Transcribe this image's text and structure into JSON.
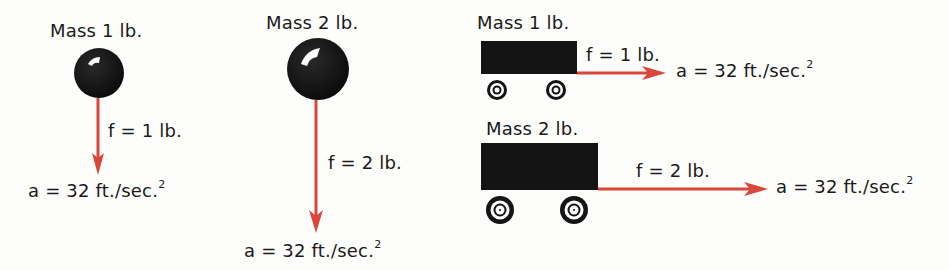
{
  "colors": {
    "arrow": "#d9473a",
    "mass": "#141414"
  },
  "panels": [
    {
      "id": "ball-1",
      "mass_label": "Mass 1 lb.",
      "force_label": "f = 1 lb.",
      "accel_label": "a = 32 ft./sec.",
      "accel_exp": "2"
    },
    {
      "id": "ball-2",
      "mass_label": "Mass 2 lb.",
      "force_label": "f = 2 lb.",
      "accel_label": "a = 32 ft./sec.",
      "accel_exp": "2"
    },
    {
      "id": "cart-1",
      "mass_label": "Mass 1 lb.",
      "force_label": "f = 1 lb.",
      "accel_label": "a = 32 ft./sec.",
      "accel_exp": "2"
    },
    {
      "id": "cart-2",
      "mass_label": "Mass 2 lb.",
      "force_label": "f = 2 lb.",
      "accel_label": "a = 32 ft./sec.",
      "accel_exp": "2"
    }
  ]
}
